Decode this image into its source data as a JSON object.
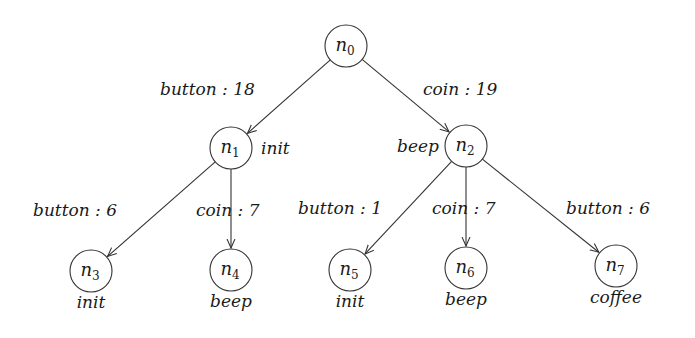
{
  "diagram": {
    "type": "tree",
    "nodes": [
      {
        "id": "n0",
        "base": "n",
        "sub": "0",
        "x": 346,
        "y": 46,
        "annotation": "",
        "ann_pos": ""
      },
      {
        "id": "n1",
        "base": "n",
        "sub": "1",
        "x": 231,
        "y": 148,
        "annotation": "init",
        "ann_pos": "right"
      },
      {
        "id": "n2",
        "base": "n",
        "sub": "2",
        "x": 466,
        "y": 146,
        "annotation": "beep",
        "ann_pos": "left"
      },
      {
        "id": "n3",
        "base": "n",
        "sub": "3",
        "x": 91,
        "y": 271,
        "annotation": "init",
        "ann_pos": "below"
      },
      {
        "id": "n4",
        "base": "n",
        "sub": "4",
        "x": 231,
        "y": 270,
        "annotation": "beep",
        "ann_pos": "below"
      },
      {
        "id": "n5",
        "base": "n",
        "sub": "5",
        "x": 350,
        "y": 270,
        "annotation": "init",
        "ann_pos": "below"
      },
      {
        "id": "n6",
        "base": "n",
        "sub": "6",
        "x": 466,
        "y": 268,
        "annotation": "beep",
        "ann_pos": "below"
      },
      {
        "id": "n7",
        "base": "n",
        "sub": "7",
        "x": 616,
        "y": 266,
        "annotation": "coffee",
        "ann_pos": "below"
      }
    ],
    "edges": [
      {
        "from": "n0",
        "to": "n1",
        "label": "button : 18",
        "lx": 160,
        "ly": 95
      },
      {
        "from": "n0",
        "to": "n2",
        "label": "coin : 19",
        "lx": 423,
        "ly": 95
      },
      {
        "from": "n1",
        "to": "n3",
        "label": "button : 6",
        "lx": 33,
        "ly": 216
      },
      {
        "from": "n1",
        "to": "n4",
        "label": "coin : 7",
        "lx": 196,
        "ly": 216
      },
      {
        "from": "n2",
        "to": "n5",
        "label": "button : 1",
        "lx": 298,
        "ly": 214
      },
      {
        "from": "n2",
        "to": "n6",
        "label": "coin : 7",
        "lx": 432,
        "ly": 214
      },
      {
        "from": "n2",
        "to": "n7",
        "label": "button : 6",
        "lx": 566,
        "ly": 214
      }
    ],
    "node_radius": 21,
    "stroke_color": "#333333"
  }
}
